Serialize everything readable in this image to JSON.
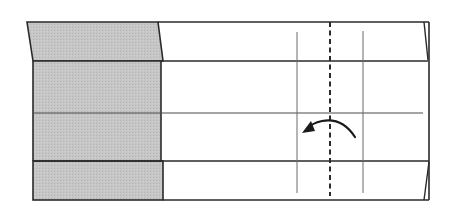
{
  "diagram": {
    "type": "origami-fold-step",
    "description": "Valley fold along the dashed center line, folding the right portion to the left",
    "colors": {
      "paper_back": "#c4c4c4",
      "paper_front": "#ffffff",
      "outline": "#2a2a2a",
      "crease": "#6a6a6a",
      "fold_line": "#2a2a2a",
      "arrow": "#1a1a1a"
    },
    "elements": {
      "paper_outline": {
        "label": "paper-strip"
      },
      "shaded_region": {
        "label": "colored side (back of paper)"
      },
      "valley_fold_line": {
        "label": "valley fold (dashed)"
      },
      "crease_lines": {
        "label": "existing creases"
      },
      "fold_arrow": {
        "label": "fold direction: right to left"
      }
    }
  }
}
